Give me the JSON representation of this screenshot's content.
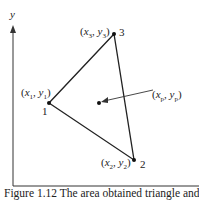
{
  "axes": {
    "x_label": "",
    "y_label": "y"
  },
  "vertices": [
    {
      "id": "1",
      "coord_label": "(x1, y1)",
      "x_sub": "1",
      "y_sub": "1"
    },
    {
      "id": "2",
      "coord_label": "(x2, y2)",
      "x_sub": "2",
      "y_sub": "2"
    },
    {
      "id": "3",
      "coord_label": "(x3, y3)",
      "x_sub": "3",
      "y_sub": "3"
    }
  ],
  "point": {
    "coord_label": "(xp, yp)",
    "x_sub": "p",
    "y_sub": "p"
  },
  "caption": "Figure 1.12  The area obtained triangle and point"
}
